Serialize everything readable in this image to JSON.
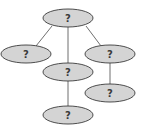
{
  "diagram": {
    "type": "tree",
    "colors": {
      "node_fill": "#d4d4d4",
      "node_stroke": "#3a3a3a",
      "edge": "#4a4a4a",
      "label": "#3a3a3a"
    },
    "nodes": [
      {
        "id": "root",
        "label": "?",
        "cx": 68,
        "cy": 18
      },
      {
        "id": "left",
        "label": "?",
        "cx": 26,
        "cy": 54
      },
      {
        "id": "middle",
        "label": "?",
        "cx": 68,
        "cy": 72
      },
      {
        "id": "right",
        "label": "?",
        "cx": 110,
        "cy": 54
      },
      {
        "id": "right-child",
        "label": "?",
        "cx": 110,
        "cy": 93
      },
      {
        "id": "bottom",
        "label": "?",
        "cx": 68,
        "cy": 115
      }
    ],
    "edges": [
      {
        "from": "root",
        "to": "left"
      },
      {
        "from": "root",
        "to": "middle"
      },
      {
        "from": "root",
        "to": "right"
      },
      {
        "from": "right",
        "to": "right-child"
      },
      {
        "from": "middle",
        "to": "bottom"
      }
    ]
  }
}
